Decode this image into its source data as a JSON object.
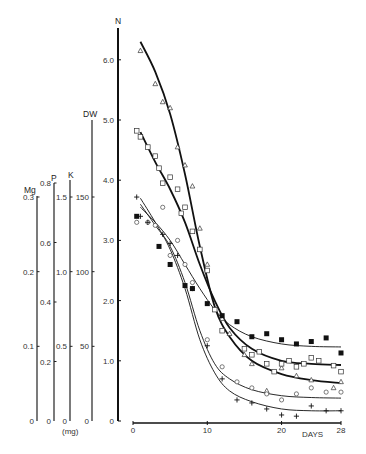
{
  "chart_data": {
    "type": "line",
    "title": "",
    "xlabel": "DAYS",
    "ylabel": "N",
    "xlim": [
      0,
      28
    ],
    "ylim": [
      0,
      6.5
    ],
    "x_ticks": [
      0,
      10,
      20,
      28
    ],
    "y_ticks": [
      {
        "value": 0,
        "label": "0"
      },
      {
        "value": 1,
        "label": "1.0"
      },
      {
        "value": 2,
        "label": "2.0"
      },
      {
        "value": 3,
        "label": "3.0"
      },
      {
        "value": 4,
        "label": "4.0"
      },
      {
        "value": 5,
        "label": "5.0"
      },
      {
        "value": 6,
        "label": "6.0"
      }
    ],
    "grid": false,
    "legend": null,
    "secondary_axes": [
      {
        "name": "Mg",
        "ticks": [
          {
            "value": 0,
            "label": "0",
            "frac": 0
          },
          {
            "value": 0.1,
            "label": "0.1",
            "frac": 0.3333
          },
          {
            "value": 0.2,
            "label": "0.2",
            "frac": 0.6667
          },
          {
            "value": 0.3,
            "label": "0.3",
            "frac": 1.0
          }
        ],
        "top_frac": 1.0
      },
      {
        "name": "P",
        "ticks": [
          {
            "value": 0,
            "label": "0",
            "frac": 0
          },
          {
            "value": 0.2,
            "label": "0.2",
            "frac": 0.25
          },
          {
            "value": 0.4,
            "label": "0.4",
            "frac": 0.5
          },
          {
            "value": 0.6,
            "label": "0.6",
            "frac": 0.75
          },
          {
            "value": 0.8,
            "label": "0.8",
            "frac": 1.0
          }
        ],
        "top_frac": 1.0
      },
      {
        "name": "K",
        "ticks": [
          {
            "value": 0,
            "label": "0",
            "frac": 0
          },
          {
            "value": 0.5,
            "label": "0.5",
            "frac": 0.3333
          },
          {
            "value": 1.0,
            "label": "1.0",
            "frac": 0.6667
          },
          {
            "value": 1.5,
            "label": "1.5",
            "frac": 1.0
          }
        ],
        "top_frac": 1.08
      },
      {
        "name": "DW",
        "ticks": [
          {
            "value": 0,
            "label": "0",
            "frac": 0
          },
          {
            "value": 50,
            "label": "50",
            "frac": 0.3333
          },
          {
            "value": 100,
            "label": "100",
            "frac": 0.6667
          },
          {
            "value": 150,
            "label": "150",
            "frac": 1.0
          }
        ],
        "top_frac": 1.33
      }
    ],
    "units_label": "(mg)",
    "series": [
      {
        "name": "N (open triangle)",
        "marker": "triangle-open",
        "line_weight": "thick",
        "curve_x": [
          1,
          3,
          5,
          7,
          9,
          11,
          13,
          16,
          20,
          24,
          28
        ],
        "curve_y": [
          6.3,
          5.8,
          5.1,
          4.1,
          2.9,
          1.9,
          1.4,
          1.0,
          0.78,
          0.68,
          0.63
        ],
        "points": [
          [
            1,
            6.15
          ],
          [
            3,
            5.6
          ],
          [
            4,
            5.3
          ],
          [
            5,
            5.2
          ],
          [
            6,
            4.55
          ],
          [
            7,
            4.25
          ],
          [
            8,
            3.9
          ],
          [
            9,
            3.2
          ],
          [
            10,
            2.6
          ],
          [
            12,
            1.7
          ],
          [
            13,
            1.45
          ],
          [
            15,
            1.1
          ],
          [
            16,
            0.95
          ],
          [
            18,
            0.5
          ],
          [
            20,
            0.88
          ],
          [
            22,
            0.75
          ],
          [
            24,
            0.68
          ],
          [
            27,
            0.55
          ],
          [
            28,
            0.65
          ]
        ]
      },
      {
        "name": "open square",
        "marker": "square-open",
        "line_weight": "thick",
        "curve_x": [
          1,
          3,
          5,
          7,
          9,
          11,
          13,
          16,
          20,
          24,
          28
        ],
        "curve_y": [
          4.8,
          4.3,
          3.85,
          3.3,
          2.6,
          2.0,
          1.55,
          1.2,
          1.0,
          0.95,
          0.93
        ],
        "points": [
          [
            0.5,
            4.82
          ],
          [
            1,
            4.72
          ],
          [
            2,
            4.55
          ],
          [
            3,
            4.4
          ],
          [
            3.5,
            4.2
          ],
          [
            4,
            3.95
          ],
          [
            5,
            4.05
          ],
          [
            6,
            3.85
          ],
          [
            6.5,
            3.45
          ],
          [
            7,
            3.55
          ],
          [
            8,
            3.15
          ],
          [
            9,
            2.85
          ],
          [
            10,
            2.5
          ],
          [
            11,
            1.85
          ],
          [
            12,
            1.5
          ],
          [
            15,
            1.2
          ],
          [
            16,
            1.1
          ],
          [
            17,
            1.15
          ],
          [
            18,
            0.95
          ],
          [
            19,
            0.82
          ],
          [
            20,
            0.95
          ],
          [
            21,
            1.0
          ],
          [
            22,
            0.9
          ],
          [
            23,
            0.95
          ],
          [
            24,
            1.05
          ],
          [
            25,
            1.0
          ],
          [
            27,
            0.92
          ],
          [
            28,
            0.82
          ]
        ]
      },
      {
        "name": "filled square",
        "marker": "square-filled",
        "line_weight": "thin",
        "curve_x": [
          1,
          3,
          5,
          7,
          9,
          11,
          13,
          16,
          20,
          24,
          28
        ],
        "curve_y": [
          3.55,
          3.3,
          3.0,
          2.6,
          2.2,
          1.85,
          1.6,
          1.4,
          1.28,
          1.24,
          1.23
        ],
        "points": [
          [
            0.5,
            3.4
          ],
          [
            3.5,
            2.9
          ],
          [
            5,
            2.6
          ],
          [
            7,
            2.25
          ],
          [
            8,
            2.2
          ],
          [
            10,
            1.95
          ],
          [
            12,
            1.75
          ],
          [
            14,
            1.65
          ],
          [
            16,
            1.4
          ],
          [
            18,
            1.45
          ],
          [
            20,
            1.35
          ],
          [
            22,
            1.28
          ],
          [
            24,
            1.32
          ],
          [
            26,
            1.38
          ],
          [
            28,
            1.13
          ]
        ]
      },
      {
        "name": "open circle",
        "marker": "circle-open",
        "line_weight": "thin",
        "curve_x": [
          1,
          3,
          5,
          7,
          9,
          11,
          13,
          16,
          20,
          24,
          28
        ],
        "curve_y": [
          3.6,
          3.25,
          2.9,
          2.3,
          1.5,
          0.95,
          0.7,
          0.52,
          0.42,
          0.39,
          0.38
        ],
        "points": [
          [
            0.5,
            3.3
          ],
          [
            2,
            3.3
          ],
          [
            3,
            3.25
          ],
          [
            4,
            3.55
          ],
          [
            5,
            2.75
          ],
          [
            6,
            3.0
          ],
          [
            7,
            2.6
          ],
          [
            8,
            2.3
          ],
          [
            10,
            1.35
          ],
          [
            12,
            0.9
          ],
          [
            14,
            0.65
          ],
          [
            16,
            0.55
          ],
          [
            18,
            0.45
          ],
          [
            20,
            0.35
          ],
          [
            22,
            0.45
          ],
          [
            24,
            0.55
          ],
          [
            26,
            0.48
          ],
          [
            28,
            0.48
          ]
        ]
      },
      {
        "name": "plus",
        "marker": "plus",
        "line_weight": "thin",
        "curve_x": [
          1,
          3,
          5,
          7,
          9,
          11,
          13,
          16,
          20,
          24,
          28
        ],
        "curve_y": [
          3.7,
          3.3,
          2.85,
          2.2,
          1.35,
          0.8,
          0.5,
          0.32,
          0.2,
          0.17,
          0.17
        ],
        "points": [
          [
            0.5,
            3.72
          ],
          [
            1,
            3.4
          ],
          [
            2,
            3.3
          ],
          [
            4,
            3.1
          ],
          [
            5,
            2.95
          ],
          [
            6,
            2.75
          ],
          [
            8,
            2.2
          ],
          [
            10,
            1.25
          ],
          [
            12,
            0.7
          ],
          [
            14,
            0.35
          ],
          [
            16,
            0.3
          ],
          [
            18,
            0.2
          ],
          [
            20,
            0.1
          ],
          [
            22,
            0.08
          ],
          [
            24,
            0.25
          ],
          [
            26,
            0.17
          ],
          [
            28,
            0.17
          ]
        ]
      }
    ]
  },
  "labels": {
    "n_axis": "N",
    "dw_axis": "DW",
    "k_axis": "K",
    "p_axis": "P",
    "mg_axis": "Mg",
    "units": "(mg)",
    "days": "DAYS"
  }
}
